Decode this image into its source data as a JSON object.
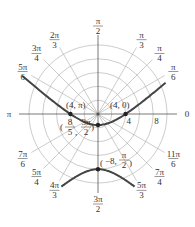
{
  "chart_data": {
    "type": "line",
    "title": "",
    "subtitle": "",
    "plot": "polar",
    "equation": "r = 4 / (1 - 1.5 sin θ)",
    "center_px": [
      98,
      114
    ],
    "px_per_unit": 6.9,
    "circles": [
      2,
      4,
      6,
      8,
      10
    ],
    "radial_tick_labels": [
      {
        "r": 4,
        "text": "4"
      },
      {
        "r": 8,
        "text": "8"
      }
    ],
    "angle_labels": [
      {
        "deg": 0,
        "num": "0",
        "den": ""
      },
      {
        "deg": 30,
        "num": "π",
        "den": "6"
      },
      {
        "deg": 45,
        "num": "π",
        "den": "4"
      },
      {
        "deg": 60,
        "num": "π",
        "den": "3"
      },
      {
        "deg": 90,
        "num": "π",
        "den": "2"
      },
      {
        "deg": 120,
        "num": "2π",
        "den": "3"
      },
      {
        "deg": 135,
        "num": "3π",
        "den": "4"
      },
      {
        "deg": 150,
        "num": "5π",
        "den": "6"
      },
      {
        "deg": 180,
        "num": "π",
        "den": ""
      },
      {
        "deg": 210,
        "num": "7π",
        "den": "6"
      },
      {
        "deg": 225,
        "num": "5π",
        "den": "4"
      },
      {
        "deg": 240,
        "num": "4π",
        "den": "3"
      },
      {
        "deg": 270,
        "num": "3π",
        "den": "2"
      },
      {
        "deg": 300,
        "num": "5π",
        "den": "3"
      },
      {
        "deg": 315,
        "num": "7π",
        "den": "4"
      },
      {
        "deg": 330,
        "num": "11π",
        "den": "6"
      }
    ],
    "points": [
      {
        "label": "(4, π)",
        "r": 4,
        "theta_deg": 180
      },
      {
        "label": "(4, 0)",
        "r": 4,
        "theta_deg": 0
      },
      {
        "label": "(8/5, 3π/2)",
        "r": 1.6,
        "theta_deg": 270
      },
      {
        "label": "(−8, π/2)",
        "r": -8,
        "theta_deg": 90
      }
    ],
    "series": [
      {
        "name": "upper branch",
        "x_range": [
          -11,
          10
        ]
      },
      {
        "name": "lower branch",
        "x_range": [
          -5.3,
          5.3
        ]
      }
    ],
    "grid": true,
    "legend": "none"
  }
}
